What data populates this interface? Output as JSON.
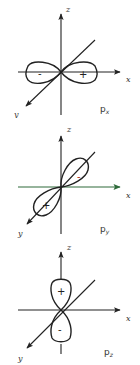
{
  "figure": {
    "panels": [
      {
        "id": "px",
        "orbital_label": "p",
        "orbital_subscript": "x",
        "axes": {
          "z": "z",
          "x": "x",
          "y": "y"
        },
        "lobes": [
          {
            "direction": "-x",
            "sign": "-"
          },
          {
            "direction": "+x",
            "sign": "+"
          }
        ],
        "x_axis_color": "#222222"
      },
      {
        "id": "py",
        "orbital_label": "p",
        "orbital_subscript": "y",
        "axes": {
          "z": "z",
          "x": "x",
          "y": "y"
        },
        "lobes": [
          {
            "direction": "-y",
            "sign": "-",
            "sign_color": "#b03020"
          },
          {
            "direction": "+y",
            "sign": "+"
          }
        ],
        "x_axis_color": "#2e6b3a"
      },
      {
        "id": "pz",
        "orbital_label": "p",
        "orbital_subscript": "z",
        "axes": {
          "z": "z",
          "x": "x",
          "y": "y"
        },
        "lobes": [
          {
            "direction": "+z",
            "sign": "+"
          },
          {
            "direction": "-z",
            "sign": "-"
          }
        ],
        "x_axis_color": "#222222"
      }
    ]
  }
}
